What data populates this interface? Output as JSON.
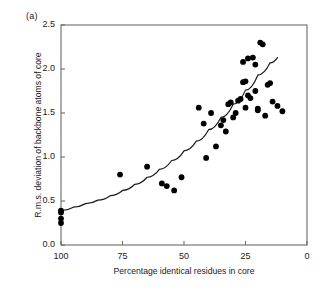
{
  "figure": {
    "panel_label": "(a)",
    "axis_color": "#6b6b6b",
    "point_color": "#000000",
    "curve_color": "#1a1a1a",
    "background": "#ffffff"
  },
  "chart_data": {
    "type": "scatter",
    "title": "",
    "subtitle": "",
    "xlabel": "Percentage identical residues in core",
    "ylabel": "R.m.s. deviation of backbone atoms of core",
    "xlim": [
      100,
      0
    ],
    "ylim": [
      0.0,
      2.5
    ],
    "x_reversed": true,
    "grid": false,
    "legend": null,
    "annotations": [
      "(a)"
    ],
    "xticks": [
      100,
      75,
      50,
      25,
      0
    ],
    "xtick_labels": [
      "100",
      "75",
      "50",
      "25",
      "0"
    ],
    "yticks": [
      0.0,
      0.5,
      1.0,
      1.5,
      2.0,
      2.5
    ],
    "ytick_labels": [
      "0.0",
      "0.5",
      "1.0",
      "1.5",
      "2.0",
      "2.5"
    ],
    "series": [
      {
        "name": "protein pairs",
        "type": "scatter",
        "marker": "filled-circle",
        "x": [
          100,
          100,
          100,
          100,
          76,
          65,
          59,
          57,
          54,
          51,
          44,
          42,
          41,
          39,
          37,
          35,
          34,
          33,
          32,
          31,
          30,
          29,
          28,
          27,
          26,
          26,
          25,
          25,
          24,
          24,
          23,
          22,
          21,
          21,
          20,
          20,
          19,
          18,
          17,
          16,
          15,
          14,
          12,
          10
        ],
        "y": [
          0.39,
          0.37,
          0.3,
          0.25,
          0.8,
          0.89,
          0.7,
          0.67,
          0.62,
          0.77,
          1.56,
          1.38,
          0.99,
          1.5,
          1.12,
          1.36,
          1.42,
          1.29,
          1.6,
          1.62,
          1.45,
          1.5,
          1.64,
          1.66,
          2.08,
          1.85,
          1.86,
          1.56,
          2.12,
          1.7,
          1.67,
          2.13,
          2.05,
          1.75,
          1.55,
          1.53,
          2.3,
          2.28,
          1.47,
          1.82,
          1.84,
          1.63,
          1.58,
          1.52
        ]
      },
      {
        "name": "fitted exponential trend",
        "type": "line",
        "x": [
          100,
          95,
          90,
          85,
          80,
          75,
          70,
          65,
          60,
          55,
          50,
          45,
          40,
          35,
          30,
          25,
          20,
          15,
          12
        ],
        "y": [
          0.39,
          0.43,
          0.47,
          0.51,
          0.56,
          0.62,
          0.69,
          0.77,
          0.86,
          0.96,
          1.07,
          1.18,
          1.31,
          1.45,
          1.6,
          1.76,
          1.93,
          2.07,
          2.13
        ]
      }
    ]
  }
}
